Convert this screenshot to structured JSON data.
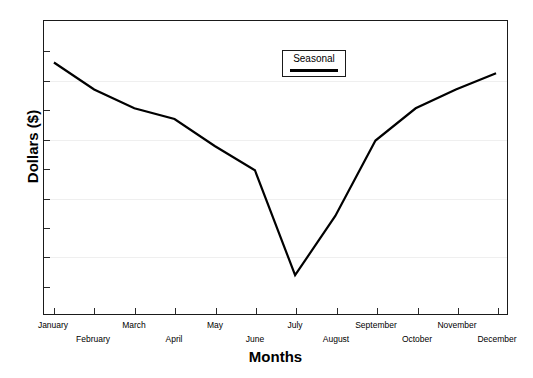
{
  "chart_data": {
    "type": "line",
    "title": "",
    "xlabel": "Months",
    "ylabel": "Dollars ($)",
    "categories": [
      "January",
      "February",
      "March",
      "April",
      "May",
      "June",
      "July",
      "August",
      "September",
      "October",
      "November",
      "December"
    ],
    "series": [
      {
        "name": "Seasonal",
        "values": [
          89,
          79,
          72,
          68,
          58,
          49,
          10,
          32,
          60,
          72,
          79,
          85
        ]
      }
    ],
    "ylim": [
      0,
      100
    ],
    "yticklabels": [],
    "grid": "horizontal",
    "gridline_count": 4,
    "legend_position": "top-center",
    "line_color": "#000000"
  },
  "legend": {
    "label": "Seasonal"
  },
  "axes": {
    "y_title": "Dollars ($)",
    "x_title": "Months"
  }
}
